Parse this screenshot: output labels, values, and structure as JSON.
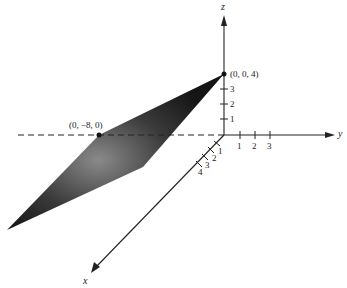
{
  "figure": {
    "axes": {
      "x": {
        "label": "x",
        "ticks": [
          "1",
          "2",
          "3",
          "4"
        ]
      },
      "y": {
        "label": "y",
        "ticks": [
          "1",
          "2",
          "3"
        ]
      },
      "z": {
        "label": "z",
        "ticks": [
          "1",
          "2",
          "3"
        ]
      }
    },
    "points": [
      {
        "label": "(0, 0, 4)"
      },
      {
        "label": "(0, −8, 0)"
      }
    ],
    "colors": {
      "axis": "#222222",
      "plane_dark": "#1a1a1a",
      "plane_light": "#8a8a8a"
    }
  }
}
